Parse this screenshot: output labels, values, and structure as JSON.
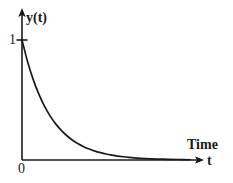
{
  "figure": {
    "background_color": "#ffffff",
    "ink_color": "#1a1a1a",
    "width": 233,
    "height": 183,
    "y_axis_label": "y(t)",
    "x_axis_label_primary": "Time",
    "x_axis_label_symbol": "t",
    "y_tick_label": "1",
    "origin_label": "0"
  },
  "chart_data": {
    "type": "line",
    "title": "",
    "subtitle": "",
    "xlabel": "Time",
    "ylabel": "y(t)",
    "xlabel_symbol": "t",
    "grid": false,
    "legend": null,
    "legend_position": "none",
    "axis_style": "arrowed-spines",
    "xlim": [
      0,
      6.2
    ],
    "ylim": [
      0,
      1.12
    ],
    "x_tick_labels": [
      "0"
    ],
    "x_tick_values": [
      0
    ],
    "y_tick_labels": [
      "1"
    ],
    "y_tick_values": [
      1
    ],
    "annotations": [],
    "series": [
      {
        "name": "exponential decay",
        "expression": "y(t) = e^(-t)",
        "color": "#1a1a1a",
        "x": [
          0.0,
          0.2,
          0.4,
          0.6,
          0.8,
          1.0,
          1.2,
          1.4,
          1.6,
          1.8,
          2.0,
          2.2,
          2.4,
          2.6,
          2.8,
          3.0,
          3.2,
          3.4,
          3.6,
          3.8,
          4.0,
          4.4,
          4.8,
          5.2,
          5.6,
          6.0
        ],
        "values": [
          1.0,
          0.819,
          0.67,
          0.549,
          0.449,
          0.368,
          0.301,
          0.247,
          0.202,
          0.165,
          0.135,
          0.111,
          0.091,
          0.074,
          0.061,
          0.05,
          0.041,
          0.033,
          0.027,
          0.022,
          0.018,
          0.012,
          0.008,
          0.006,
          0.004,
          0.002
        ]
      }
    ]
  }
}
